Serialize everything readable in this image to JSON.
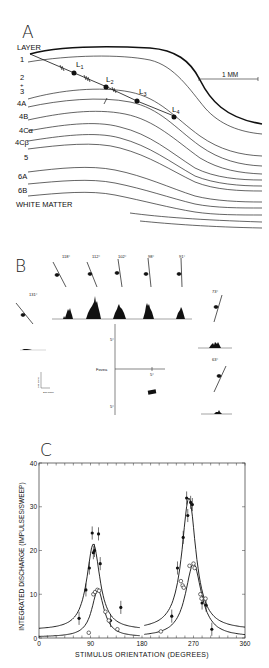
{
  "figure": {
    "panels": [
      {
        "id": "A",
        "letter": "A",
        "header": "LAYER",
        "layers": [
          "1",
          "2",
          "+",
          "3",
          "4A",
          "4B",
          "4Cα",
          "4Cβ",
          "5",
          "6A",
          "6B",
          "WHITE MATTER"
        ],
        "lesion_labels": [
          "L",
          "L",
          "L",
          "L"
        ],
        "lesion_subscripts": [
          "1",
          "2",
          "3",
          "4"
        ],
        "scale_bar": "1 MM"
      },
      {
        "id": "B",
        "letter": "B",
        "orientation_labels": [
          "118°",
          "112°",
          "102°",
          "98°",
          "91°",
          "73°",
          "63°",
          "131°"
        ],
        "fovea_label": "Fovea",
        "axis_tick_labels": [
          "5°",
          "5°",
          "5°"
        ],
        "scale_labels": [
          "100 imp/s",
          "200 msec"
        ]
      },
      {
        "id": "C",
        "letter": "C"
      }
    ]
  },
  "chart_data": {
    "type": "scatter",
    "title": "",
    "xlabel": "STIMULUS ORIENTATION (DEGREES)",
    "ylabel": "INTEGRATED DISCHARGE (IMPULSES/SWEEP)",
    "xlim": [
      0,
      360
    ],
    "ylim": [
      0,
      40
    ],
    "xticks": [
      0,
      90,
      180,
      270,
      360
    ],
    "xtick_labels": [
      "0",
      "90",
      "180",
      "270",
      "360"
    ],
    "yticks": [
      0,
      10,
      20,
      30,
      40
    ],
    "ytick_labels": [
      "0",
      "10",
      "20",
      "30",
      "40"
    ],
    "grid": false,
    "legend": "none",
    "series": [
      {
        "name": "filled circles (binocular/dominant eye)",
        "marker": "filled-circle",
        "points": [
          [
            70,
            4.5
          ],
          [
            82,
            11
          ],
          [
            88,
            16
          ],
          [
            93,
            24
          ],
          [
            95,
            19.5
          ],
          [
            97,
            20
          ],
          [
            104,
            23.8
          ],
          [
            107,
            17
          ],
          [
            125,
            4
          ],
          [
            143,
            7
          ],
          [
            232,
            5
          ],
          [
            242,
            16
          ],
          [
            252,
            23
          ],
          [
            258,
            32
          ],
          [
            260,
            28
          ],
          [
            265,
            31
          ],
          [
            268,
            30.5
          ],
          [
            285,
            8
          ],
          [
            292,
            7.5
          ],
          [
            302,
            2
          ]
        ],
        "fit_peak_1": {
          "x": 95,
          "y": 21.5
        },
        "fit_peak_2": {
          "x": 262,
          "y": 32
        },
        "baseline": 1.8
      },
      {
        "name": "open circles (other eye)",
        "marker": "open-circle",
        "points": [
          [
            87,
            1.2
          ],
          [
            95,
            10
          ],
          [
            98,
            10.5
          ],
          [
            102,
            11
          ],
          [
            105,
            10.8
          ],
          [
            116,
            6
          ],
          [
            122,
            4
          ],
          [
            137,
            2
          ],
          [
            213,
            1.5
          ],
          [
            248,
            13
          ],
          [
            251,
            12
          ],
          [
            253,
            11.5
          ],
          [
            263,
            16.5
          ],
          [
            270,
            17
          ],
          [
            272,
            16
          ],
          [
            282,
            10
          ],
          [
            284,
            9
          ],
          [
            291,
            9
          ]
        ],
        "fit_peak_1": {
          "x": 103,
          "y": 11
        },
        "fit_peak_2": {
          "x": 270,
          "y": 17
        },
        "baseline": 0.2
      }
    ]
  }
}
